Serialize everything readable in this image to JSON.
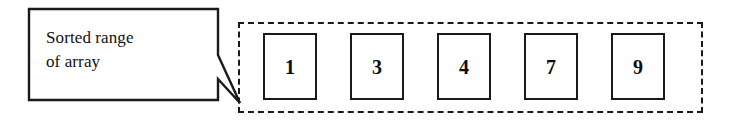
{
  "figure": {
    "background_color": "#ffffff",
    "line_color": "#1a1a1a"
  },
  "callout": {
    "label": "Sorted range\nof array",
    "line1": "Sorted range",
    "line2": "of array",
    "shape": "speech-balloon",
    "tail_direction": "down-right"
  },
  "range_container": {
    "border_style": "dashed",
    "border_color": "#1a1a1a",
    "description": "Sorted range of array"
  },
  "array": {
    "cells": [
      {
        "value": "1"
      },
      {
        "value": "3"
      },
      {
        "value": "4"
      },
      {
        "value": "7"
      },
      {
        "value": "9"
      }
    ]
  }
}
